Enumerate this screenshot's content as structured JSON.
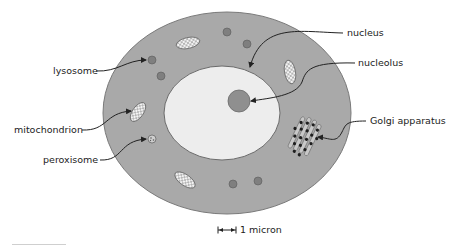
{
  "diagram": {
    "type": "animal cell diagram",
    "labels": {
      "lysosome": "lysosome",
      "mitochondrion": "mitochondrion",
      "peroxisome": "peroxisome",
      "nucleus": "nucleus",
      "nucleolus": "nucleolus",
      "golgi": "Golgi apparatus"
    },
    "scale_bar": {
      "label": "1 micron"
    },
    "colors": {
      "cytoplasm": "#a9a9a9",
      "cell_border": "#7a7a7a",
      "nucleus_fill": "#ededed",
      "nucleolus_fill": "#8f8f8f",
      "organelle_dot": "#7f7f7f",
      "mitochondrion_fill": "#f4f4f4",
      "text": "#222222",
      "arrow": "#222222"
    }
  }
}
